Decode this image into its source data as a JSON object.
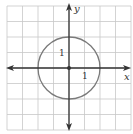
{
  "chart_data": {
    "type": "line",
    "title": "",
    "xlabel": "x",
    "ylabel": "y",
    "xlim": [
      -4,
      4
    ],
    "ylim": [
      -4,
      4
    ],
    "grid": true,
    "tick_labels": {
      "x": [
        "1"
      ],
      "y": [
        "1"
      ]
    },
    "series": [
      {
        "name": "circle",
        "center": [
          0,
          0
        ],
        "radius": 2
      }
    ],
    "points": [
      {
        "x": 0,
        "y": 0,
        "label": "center"
      }
    ]
  },
  "labels": {
    "x_axis": "x",
    "y_axis": "y",
    "x_tick": "1",
    "y_tick": "1"
  },
  "colors": {
    "grid": "#c8c8c8",
    "axis": "#333333",
    "curve": "#7a7a7a"
  }
}
